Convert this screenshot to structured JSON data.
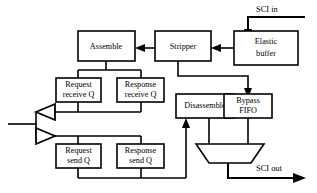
{
  "diagram": {
    "colors": {
      "background": "#ffffff",
      "stroke": "#000000",
      "fill": "#ffffff"
    },
    "io_ports": [
      {
        "id": "sci_in",
        "label": "SCI in",
        "direction": "input"
      },
      {
        "id": "sci_out",
        "label": "SCI out",
        "direction": "output"
      }
    ],
    "blocks": [
      {
        "id": "elastic_buffer",
        "line1": "Elastic",
        "line2": "buffer"
      },
      {
        "id": "stripper",
        "line1": "Stripper",
        "line2": ""
      },
      {
        "id": "assemble",
        "line1": "Assemble",
        "line2": ""
      },
      {
        "id": "request_receive_q",
        "line1": "Request",
        "line2": "receive Q"
      },
      {
        "id": "response_receive_q",
        "line1": "Response",
        "line2": "receive Q"
      },
      {
        "id": "request_send_q",
        "line1": "Request",
        "line2": "send Q"
      },
      {
        "id": "response_send_q",
        "line1": "Response",
        "line2": "send Q"
      },
      {
        "id": "disassemble",
        "line1": "Disassemble",
        "line2": ""
      },
      {
        "id": "bypass_fifo",
        "line1": "Bypass",
        "line2": "FIFO"
      },
      {
        "id": "output_mux",
        "line1": "",
        "line2": ""
      }
    ],
    "buffers": [
      {
        "id": "receive_buffer",
        "orientation": "left"
      },
      {
        "id": "send_buffer",
        "orientation": "right"
      }
    ]
  }
}
